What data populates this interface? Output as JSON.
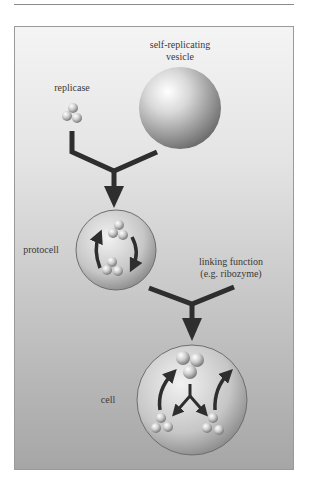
{
  "figure": {
    "labels": {
      "vesicle_line1": "self-replicating",
      "vesicle_line2": "vesicle",
      "replicase": "replicase",
      "protocell": "protocell",
      "linking_line1": "linking function",
      "linking_line2": "(e.g. ribozyme)",
      "cell": "cell"
    },
    "nodes": [
      {
        "id": "replicase",
        "label": "replicase"
      },
      {
        "id": "vesicle",
        "label": "self-replicating vesicle"
      },
      {
        "id": "protocell",
        "label": "protocell"
      },
      {
        "id": "linking_function",
        "label": "linking function (e.g. ribozyme)"
      },
      {
        "id": "cell",
        "label": "cell"
      }
    ],
    "edges": [
      {
        "from": "replicase",
        "to": "protocell"
      },
      {
        "from": "vesicle",
        "to": "protocell"
      },
      {
        "from": "protocell",
        "to": "cell"
      },
      {
        "from": "linking_function",
        "to": "cell"
      }
    ],
    "colors": {
      "arrow": "#2e2e2e",
      "panel_top": "#f4f4f4",
      "panel_bottom": "#a6a6a6"
    }
  }
}
